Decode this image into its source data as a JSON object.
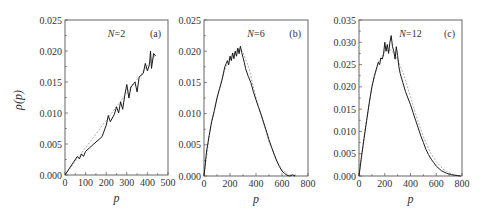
{
  "figure": {
    "y_axis_label": "ρ(p)",
    "x_axis_label": "p"
  },
  "chart_data": [
    {
      "type": "line",
      "panel": "(a)",
      "annotation": "N=2",
      "xlabel": "p",
      "ylabel": "ρ(p)",
      "xlim": [
        0,
        500
      ],
      "ylim": [
        0,
        0.025
      ],
      "x_ticks": [
        "0",
        "100",
        "200",
        "300",
        "400",
        "500"
      ],
      "y_ticks": [
        "0.000",
        "0.005",
        "0.010",
        "0.015",
        "0.020",
        "0.025"
      ],
      "grid": false,
      "series": [
        {
          "name": "simulation",
          "x": [
            0,
            20,
            40,
            60,
            70,
            80,
            90,
            100,
            120,
            140,
            160,
            180,
            200,
            210,
            220,
            240,
            250,
            260,
            270,
            280,
            290,
            300,
            310,
            320,
            340,
            350,
            360,
            380,
            390,
            400,
            410,
            415,
            420,
            430,
            440
          ],
          "y": [
            0.0,
            0.001,
            0.002,
            0.003,
            0.0026,
            0.0034,
            0.003,
            0.0038,
            0.0044,
            0.005,
            0.0056,
            0.0062,
            0.008,
            0.0096,
            0.0086,
            0.0098,
            0.011,
            0.01,
            0.0118,
            0.0106,
            0.0128,
            0.0146,
            0.0124,
            0.0142,
            0.015,
            0.0134,
            0.0158,
            0.0164,
            0.018,
            0.0168,
            0.0178,
            0.02,
            0.0172,
            0.0196,
            0.0192
          ]
        },
        {
          "name": "theory",
          "x": [
            0,
            440
          ],
          "y": [
            0.0,
            0.0194
          ]
        }
      ]
    },
    {
      "type": "line",
      "panel": "(b)",
      "annotation": "N=6",
      "xlabel": "p",
      "ylabel": "ρ(p)",
      "xlim": [
        0,
        800
      ],
      "ylim": [
        0,
        0.025
      ],
      "x_ticks": [
        "0",
        "200",
        "400",
        "600",
        "800"
      ],
      "y_ticks": [
        "0.000",
        "0.005",
        "0.010",
        "0.015",
        "0.020",
        "0.025"
      ],
      "grid": false,
      "series": [
        {
          "name": "simulation",
          "x": [
            0,
            20,
            40,
            60,
            80,
            100,
            120,
            140,
            160,
            170,
            180,
            190,
            200,
            210,
            220,
            230,
            240,
            250,
            260,
            270,
            280,
            290,
            300,
            310,
            320,
            340,
            360,
            380,
            400,
            420,
            440,
            460,
            480,
            500,
            520,
            540,
            560,
            580,
            600,
            620,
            640,
            660,
            680,
            700
          ],
          "y": [
            0.0,
            0.004,
            0.0065,
            0.0088,
            0.0105,
            0.0125,
            0.014,
            0.0155,
            0.0175,
            0.018,
            0.0185,
            0.0178,
            0.0192,
            0.0185,
            0.0197,
            0.0188,
            0.02,
            0.0192,
            0.0205,
            0.0196,
            0.0208,
            0.0198,
            0.019,
            0.0182,
            0.0172,
            0.016,
            0.015,
            0.0135,
            0.0122,
            0.011,
            0.0098,
            0.0085,
            0.0072,
            0.0058,
            0.0046,
            0.0035,
            0.0024,
            0.0015,
            0.0008,
            0.0004,
            0.0001,
            0.0,
            0.0002,
            0.0
          ]
        },
        {
          "name": "theory",
          "x": [
            0,
            50,
            100,
            150,
            200,
            250,
            280,
            300,
            350,
            400,
            450,
            500,
            550,
            600,
            650,
            700
          ],
          "y": [
            0.0,
            0.008,
            0.0125,
            0.0165,
            0.019,
            0.0201,
            0.0203,
            0.0198,
            0.017,
            0.0125,
            0.009,
            0.0055,
            0.0028,
            0.001,
            0.0002,
            0.0
          ]
        }
      ]
    },
    {
      "type": "line",
      "panel": "(c)",
      "annotation": "N=12",
      "xlabel": "p",
      "ylabel": "ρ(p)",
      "xlim": [
        0,
        800
      ],
      "ylim": [
        0,
        0.035
      ],
      "x_ticks": [
        "0",
        "200",
        "400",
        "600",
        "800"
      ],
      "y_ticks": [
        "0.000",
        "0.005",
        "0.010",
        "0.015",
        "0.020",
        "0.025",
        "0.030",
        "0.035"
      ],
      "grid": false,
      "series": [
        {
          "name": "simulation",
          "x": [
            0,
            20,
            40,
            60,
            80,
            100,
            120,
            140,
            150,
            160,
            170,
            180,
            190,
            200,
            210,
            220,
            230,
            240,
            250,
            260,
            270,
            280,
            290,
            300,
            310,
            320,
            340,
            360,
            380,
            400,
            420,
            440,
            460,
            480,
            500,
            520,
            540,
            560,
            580,
            600,
            640,
            680,
            720,
            760,
            790
          ],
          "y": [
            0.0,
            0.0045,
            0.0085,
            0.0125,
            0.0165,
            0.02,
            0.0225,
            0.0245,
            0.0255,
            0.025,
            0.0265,
            0.0262,
            0.0272,
            0.03,
            0.028,
            0.0295,
            0.0275,
            0.03,
            0.0315,
            0.029,
            0.028,
            0.0262,
            0.029,
            0.027,
            0.0245,
            0.023,
            0.021,
            0.019,
            0.0175,
            0.016,
            0.0142,
            0.0125,
            0.0108,
            0.009,
            0.0075,
            0.006,
            0.0048,
            0.0038,
            0.003,
            0.0022,
            0.0012,
            0.0006,
            0.0003,
            0.0001,
            0.0
          ]
        },
        {
          "name": "theory",
          "x": [
            0,
            50,
            100,
            150,
            200,
            250,
            300,
            350,
            400,
            450,
            500,
            550,
            600,
            650,
            700,
            750,
            800
          ],
          "y": [
            0.0,
            0.011,
            0.02,
            0.0255,
            0.028,
            0.0283,
            0.0262,
            0.0225,
            0.0178,
            0.013,
            0.0088,
            0.0055,
            0.0032,
            0.0016,
            0.0007,
            0.0002,
            0.0
          ]
        }
      ]
    }
  ],
  "layout": {
    "panels": [
      {
        "left": 65,
        "right": 168,
        "top": 20,
        "bottom": 175
      },
      {
        "left": 204,
        "right": 308,
        "top": 20,
        "bottom": 176
      },
      {
        "left": 359,
        "right": 462,
        "top": 20,
        "bottom": 176
      }
    ]
  }
}
